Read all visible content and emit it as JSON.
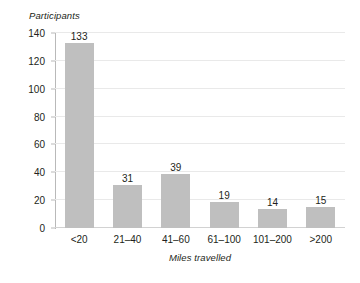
{
  "chart_data": {
    "type": "bar",
    "title": "",
    "categories": [
      "<20",
      "21–40",
      "41–60",
      "61–100",
      "101–200",
      ">200"
    ],
    "values": [
      133,
      31,
      39,
      19,
      14,
      15
    ],
    "xlabel": "Miles travelled",
    "ylabel": "Participants",
    "ylim": [
      0,
      140
    ],
    "yticks": [
      0,
      20,
      40,
      60,
      80,
      100,
      120,
      140
    ],
    "grid": true,
    "legend": false,
    "bar_color": "#bfbfbf",
    "gridline_color": "#e9e9e9",
    "axis_color": "#b9b9b9",
    "text_color": "#231f20",
    "data_labels": [
      "133",
      "31",
      "39",
      "19",
      "14",
      "15"
    ]
  }
}
